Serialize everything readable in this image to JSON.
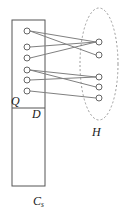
{
  "figure": {
    "background": "#ffffff",
    "width": 124,
    "height": 215,
    "stroke_color": "#808080",
    "node_stroke": "#666666",
    "node_fill": "#ffffff",
    "box_stroke": "#555555",
    "ellipse_stroke": "#999999",
    "label_color": "#1a1a1a"
  },
  "labels": {
    "q": "Q",
    "d": "D",
    "h": "H",
    "cs_base": "C",
    "cs_sub": "s"
  },
  "container_box": {
    "name": "C_s rectangle",
    "x": 12,
    "y": 20,
    "width": 33,
    "height": 166,
    "divider_y": 108
  },
  "ellipse": {
    "name": "H ellipse",
    "cx": 99,
    "cy": 64,
    "rx": 19,
    "ry": 56,
    "dashed": true
  },
  "left_nodes": [
    {
      "id": "q1",
      "cx": 27,
      "cy": 31,
      "r": 3
    },
    {
      "id": "q2",
      "cx": 27,
      "cy": 47,
      "r": 3
    },
    {
      "id": "q3",
      "cx": 27,
      "cy": 58,
      "r": 3
    },
    {
      "id": "q4",
      "cx": 27,
      "cy": 70,
      "r": 3
    },
    {
      "id": "q5",
      "cx": 27,
      "cy": 80,
      "r": 3
    },
    {
      "id": "q6",
      "cx": 27,
      "cy": 91,
      "r": 3
    }
  ],
  "right_nodes": [
    {
      "id": "h1",
      "cx": 99,
      "cy": 42,
      "r": 3
    },
    {
      "id": "h2",
      "cx": 99,
      "cy": 55,
      "r": 3
    },
    {
      "id": "h3",
      "cx": 99,
      "cy": 77,
      "r": 3
    },
    {
      "id": "h4",
      "cx": 99,
      "cy": 87,
      "r": 3
    },
    {
      "id": "h5",
      "cx": 99,
      "cy": 98,
      "r": 3
    }
  ],
  "edges": [
    {
      "from": "q1",
      "to": "h1"
    },
    {
      "from": "q1",
      "to": "h2"
    },
    {
      "from": "q2",
      "to": "h1"
    },
    {
      "from": "q3",
      "to": "h1"
    },
    {
      "from": "q4",
      "to": "h3"
    },
    {
      "from": "q4",
      "to": "h4"
    },
    {
      "from": "q5",
      "to": "h3"
    },
    {
      "from": "q6",
      "to": "h5"
    }
  ],
  "counts": {
    "left_node_count": 6,
    "right_node_count": 5,
    "edge_count": 8
  }
}
